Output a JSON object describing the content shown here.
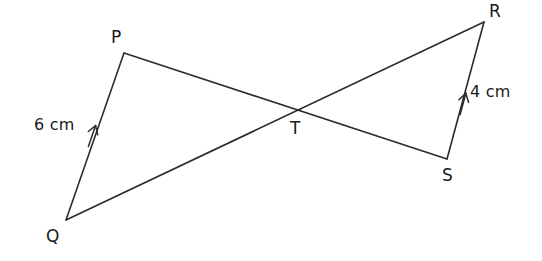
{
  "figure": {
    "type": "geometry-diagram",
    "background_color": "#ffffff",
    "stroke_color": "#2b2b2b",
    "text_color": "#1a1a1a"
  },
  "points": [
    {
      "id": "P",
      "label": "P",
      "x": 124,
      "y": 53,
      "label_x": 111,
      "label_y": 29
    },
    {
      "id": "Q",
      "label": "Q",
      "x": 66,
      "y": 220,
      "label_x": 46,
      "label_y": 228
    },
    {
      "id": "R",
      "label": "R",
      "x": 484,
      "y": 22,
      "label_x": 489,
      "label_y": 3
    },
    {
      "id": "S",
      "label": "S",
      "x": 447,
      "y": 159,
      "label_x": 442,
      "label_y": 167
    },
    {
      "id": "T",
      "label": "T",
      "x": 296,
      "y": 108,
      "label_x": 290,
      "label_y": 120
    }
  ],
  "segments": [
    {
      "id": "QP",
      "from": "Q",
      "to": "P",
      "x1": 66,
      "y1": 220,
      "x2": 124,
      "y2": 53
    },
    {
      "id": "PS",
      "from": "P",
      "to": "S",
      "x1": 124,
      "y1": 53,
      "x2": 447,
      "y2": 159
    },
    {
      "id": "QR",
      "from": "Q",
      "to": "R",
      "x1": 66,
      "y1": 220,
      "x2": 484,
      "y2": 22
    },
    {
      "id": "SR",
      "from": "S",
      "to": "R",
      "x1": 447,
      "y1": 159,
      "x2": 484,
      "y2": 22
    }
  ],
  "arrow_markers": [
    {
      "id": "arrow-qp",
      "on_segment": "QP",
      "x": 92,
      "y": 136,
      "angle_deg": -70.8,
      "direction": "towards-P"
    },
    {
      "id": "arrow-sr",
      "on_segment": "SR",
      "x": 463,
      "y": 104,
      "angle_deg": -74.9,
      "direction": "towards-R"
    }
  ],
  "measurements": [
    {
      "id": "len-qp",
      "value": "6",
      "unit": "cm",
      "text": "6 cm",
      "on_segment": "QP",
      "x": 34,
      "y": 117
    },
    {
      "id": "len-sr",
      "value": "4",
      "unit": "cm",
      "text": "4 cm",
      "on_segment": "SR",
      "x": 470,
      "y": 84
    }
  ]
}
